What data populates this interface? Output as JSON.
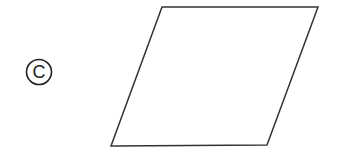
{
  "diagram": {
    "label": {
      "text": "C",
      "style": "circled",
      "color": "#222222",
      "center": [
        39,
        72
      ],
      "radius": 13
    },
    "shape": {
      "type": "parallelogram",
      "stroke": "#333333",
      "fill": "#ffffff",
      "stroke_width": 1.5,
      "vertices": [
        [
          162,
          7
        ],
        [
          318,
          7
        ],
        [
          267,
          145
        ],
        [
          111,
          146
        ]
      ]
    }
  }
}
